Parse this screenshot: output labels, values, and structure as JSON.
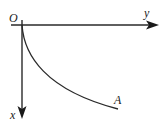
{
  "diagram": {
    "origin_label": "O",
    "horizontal_axis_label": "y",
    "vertical_axis_label": "x",
    "point_label": "A",
    "colors": {
      "stroke": "#2a2a2a",
      "background": "#ffffff"
    }
  }
}
